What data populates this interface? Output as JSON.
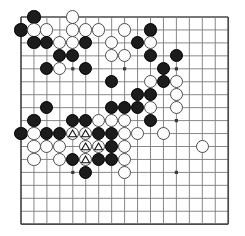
{
  "board": {
    "title": "Go board position",
    "type": "go-board",
    "columns": 17,
    "rows": 17,
    "origin_x": 21,
    "origin_y": 17,
    "spacing": 12.95,
    "stone_radius": 6.6,
    "line_color": "#7a7a7a",
    "edge_color": "#4a4a4a",
    "black_color": "#1c1c1c",
    "white_color": "#fdfdfd",
    "background_color": "#ffffff",
    "marker_symbol": "triangle",
    "star_points": [
      {
        "col": 4,
        "row": 4
      },
      {
        "col": 8,
        "row": 4
      },
      {
        "col": 12,
        "row": 4
      },
      {
        "col": 4,
        "row": 8
      },
      {
        "col": 8,
        "row": 8
      },
      {
        "col": 12,
        "row": 8
      },
      {
        "col": 4,
        "row": 12
      },
      {
        "col": 8,
        "row": 12
      },
      {
        "col": 12,
        "row": 12
      }
    ],
    "stones": [
      {
        "col": 1,
        "row": 0,
        "color": "black",
        "mark": ""
      },
      {
        "col": 4,
        "row": 0,
        "color": "white",
        "mark": ""
      },
      {
        "col": 0,
        "row": 1,
        "color": "black",
        "mark": ""
      },
      {
        "col": 1,
        "row": 1,
        "color": "white",
        "mark": ""
      },
      {
        "col": 2,
        "row": 1,
        "color": "white",
        "mark": ""
      },
      {
        "col": 4,
        "row": 1,
        "color": "white",
        "mark": ""
      },
      {
        "col": 5,
        "row": 1,
        "color": "white",
        "mark": ""
      },
      {
        "col": 6,
        "row": 1,
        "color": "white",
        "mark": ""
      },
      {
        "col": 8,
        "row": 1,
        "color": "white",
        "mark": ""
      },
      {
        "col": 10,
        "row": 1,
        "color": "black",
        "mark": ""
      },
      {
        "col": 1,
        "row": 2,
        "color": "black",
        "mark": ""
      },
      {
        "col": 2,
        "row": 2,
        "color": "black",
        "mark": ""
      },
      {
        "col": 3,
        "row": 2,
        "color": "white",
        "mark": ""
      },
      {
        "col": 4,
        "row": 2,
        "color": "white",
        "mark": ""
      },
      {
        "col": 5,
        "row": 2,
        "color": "black",
        "mark": ""
      },
      {
        "col": 7,
        "row": 2,
        "color": "white",
        "mark": ""
      },
      {
        "col": 9,
        "row": 2,
        "color": "black",
        "mark": ""
      },
      {
        "col": 10,
        "row": 2,
        "color": "white",
        "mark": ""
      },
      {
        "col": 3,
        "row": 3,
        "color": "black",
        "mark": ""
      },
      {
        "col": 4,
        "row": 3,
        "color": "black",
        "mark": ""
      },
      {
        "col": 7,
        "row": 3,
        "color": "white",
        "mark": ""
      },
      {
        "col": 8,
        "row": 3,
        "color": "white",
        "mark": ""
      },
      {
        "col": 10,
        "row": 3,
        "color": "black",
        "mark": ""
      },
      {
        "col": 12,
        "row": 3,
        "color": "black",
        "mark": ""
      },
      {
        "col": 2,
        "row": 4,
        "color": "black",
        "mark": ""
      },
      {
        "col": 3,
        "row": 4,
        "color": "white",
        "mark": ""
      },
      {
        "col": 5,
        "row": 4,
        "color": "black",
        "mark": ""
      },
      {
        "col": 11,
        "row": 4,
        "color": "black",
        "mark": ""
      },
      {
        "col": 7,
        "row": 5,
        "color": "black",
        "mark": ""
      },
      {
        "col": 10,
        "row": 5,
        "color": "white",
        "mark": ""
      },
      {
        "col": 11,
        "row": 5,
        "color": "black",
        "mark": ""
      },
      {
        "col": 12,
        "row": 5,
        "color": "white",
        "mark": ""
      },
      {
        "col": 9,
        "row": 6,
        "color": "black",
        "mark": ""
      },
      {
        "col": 10,
        "row": 6,
        "color": "black",
        "mark": ""
      },
      {
        "col": 12,
        "row": 6,
        "color": "white",
        "mark": ""
      },
      {
        "col": 2,
        "row": 7,
        "color": "black",
        "mark": ""
      },
      {
        "col": 7,
        "row": 7,
        "color": "black",
        "mark": ""
      },
      {
        "col": 8,
        "row": 7,
        "color": "black",
        "mark": ""
      },
      {
        "col": 9,
        "row": 7,
        "color": "black",
        "mark": ""
      },
      {
        "col": 10,
        "row": 7,
        "color": "white",
        "mark": ""
      },
      {
        "col": 12,
        "row": 7,
        "color": "white",
        "mark": ""
      },
      {
        "col": 1,
        "row": 8,
        "color": "black",
        "mark": ""
      },
      {
        "col": 4,
        "row": 8,
        "color": "black",
        "mark": ""
      },
      {
        "col": 5,
        "row": 8,
        "color": "black",
        "mark": ""
      },
      {
        "col": 6,
        "row": 8,
        "color": "white",
        "mark": ""
      },
      {
        "col": 7,
        "row": 8,
        "color": "white",
        "mark": ""
      },
      {
        "col": 8,
        "row": 8,
        "color": "white",
        "mark": ""
      },
      {
        "col": 10,
        "row": 8,
        "color": "black",
        "mark": ""
      },
      {
        "col": 0,
        "row": 9,
        "color": "black",
        "mark": ""
      },
      {
        "col": 1,
        "row": 9,
        "color": "white",
        "mark": ""
      },
      {
        "col": 2,
        "row": 9,
        "color": "black",
        "mark": ""
      },
      {
        "col": 3,
        "row": 9,
        "color": "black",
        "mark": ""
      },
      {
        "col": 4,
        "row": 9,
        "color": "white",
        "mark": "triangle"
      },
      {
        "col": 5,
        "row": 9,
        "color": "white",
        "mark": "triangle"
      },
      {
        "col": 6,
        "row": 9,
        "color": "black",
        "mark": ""
      },
      {
        "col": 7,
        "row": 9,
        "color": "black",
        "mark": ""
      },
      {
        "col": 8,
        "row": 9,
        "color": "white",
        "mark": ""
      },
      {
        "col": 9,
        "row": 9,
        "color": "white",
        "mark": ""
      },
      {
        "col": 11,
        "row": 9,
        "color": "white",
        "mark": ""
      },
      {
        "col": 1,
        "row": 10,
        "color": "white",
        "mark": ""
      },
      {
        "col": 2,
        "row": 10,
        "color": "white",
        "mark": ""
      },
      {
        "col": 3,
        "row": 10,
        "color": "white",
        "mark": ""
      },
      {
        "col": 5,
        "row": 10,
        "color": "white",
        "mark": "triangle"
      },
      {
        "col": 6,
        "row": 10,
        "color": "white",
        "mark": "triangle"
      },
      {
        "col": 7,
        "row": 10,
        "color": "black",
        "mark": ""
      },
      {
        "col": 8,
        "row": 10,
        "color": "white",
        "mark": ""
      },
      {
        "col": 14,
        "row": 10,
        "color": "white",
        "mark": ""
      },
      {
        "col": 1,
        "row": 11,
        "color": "white",
        "mark": ""
      },
      {
        "col": 3,
        "row": 11,
        "color": "white",
        "mark": ""
      },
      {
        "col": 4,
        "row": 11,
        "color": "black",
        "mark": ""
      },
      {
        "col": 5,
        "row": 11,
        "color": "white",
        "mark": "triangle"
      },
      {
        "col": 6,
        "row": 11,
        "color": "black",
        "mark": ""
      },
      {
        "col": 7,
        "row": 11,
        "color": "black",
        "mark": ""
      },
      {
        "col": 8,
        "row": 11,
        "color": "white",
        "mark": ""
      },
      {
        "col": 5,
        "row": 12,
        "color": "black",
        "mark": ""
      },
      {
        "col": 8,
        "row": 12,
        "color": "white",
        "mark": ""
      }
    ]
  }
}
